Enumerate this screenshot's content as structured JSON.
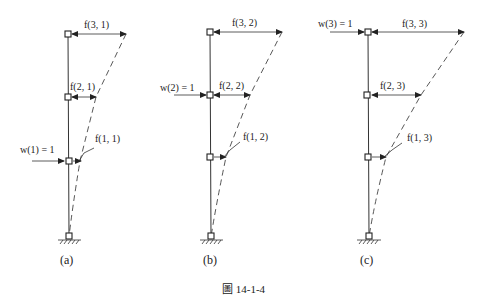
{
  "figure": {
    "caption": "圖 14-1-4",
    "panels": [
      {
        "id": "a",
        "label": "(a)",
        "load_label": "w(1) = 1",
        "load_node": 1,
        "nodes": [
          {
            "level": 3,
            "flex_label": "f(3, 1)"
          },
          {
            "level": 2,
            "flex_label": "f(2, 1)"
          },
          {
            "level": 1,
            "flex_label": "f(1, 1)"
          }
        ]
      },
      {
        "id": "b",
        "label": "(b)",
        "load_label": "w(2) = 1",
        "load_node": 2,
        "nodes": [
          {
            "level": 3,
            "flex_label": "f(3, 2)"
          },
          {
            "level": 2,
            "flex_label": "f(2, 2)"
          },
          {
            "level": 1,
            "flex_label": "f(1, 2)"
          }
        ]
      },
      {
        "id": "c",
        "label": "(c)",
        "load_label": "w(3) = 1",
        "load_node": 3,
        "nodes": [
          {
            "level": 3,
            "flex_label": "f(3, 3)"
          },
          {
            "level": 2,
            "flex_label": "f(2, 3)"
          },
          {
            "level": 1,
            "flex_label": "f(1, 3)"
          }
        ]
      }
    ]
  }
}
